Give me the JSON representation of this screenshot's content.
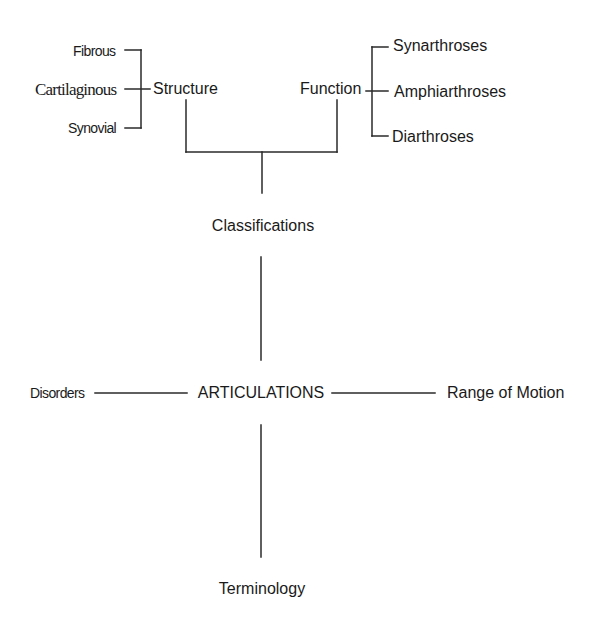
{
  "diagram": {
    "root": {
      "label": "ARTICULATIONS"
    },
    "branches": {
      "up": {
        "label": "Classifications"
      },
      "left": {
        "label": "Disorders"
      },
      "right": {
        "label": "Range of Motion"
      },
      "down": {
        "label": "Terminology"
      }
    },
    "classifications": {
      "structure": {
        "label": "Structure",
        "children": [
          "Fibrous",
          "Cartilaginous",
          "Synovial"
        ]
      },
      "function": {
        "label": "Function",
        "children": [
          "Synarthroses",
          "Amphiarthroses",
          "Diarthroses"
        ]
      }
    },
    "colors": {
      "line": "#2a2a2a",
      "text": "#1a1a1a",
      "background": "#ffffff"
    }
  }
}
